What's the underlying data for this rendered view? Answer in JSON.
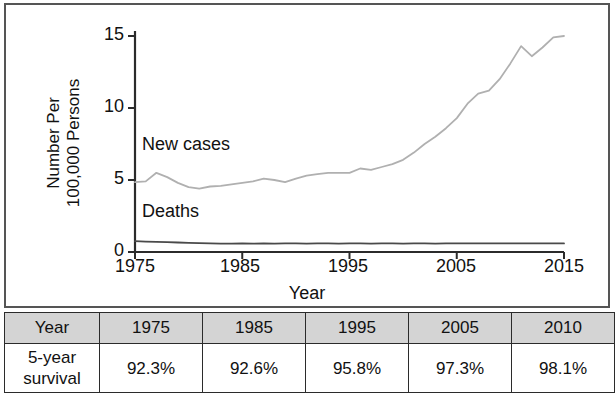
{
  "chart_data": {
    "type": "line",
    "title": "",
    "xlabel": "Year",
    "ylabel_line1": "Number Per",
    "ylabel_line2": "100,000 Persons",
    "xlim": [
      1975,
      2015
    ],
    "ylim": [
      0,
      15
    ],
    "xticks": [
      "1975",
      "1985",
      "1995",
      "2005",
      "2015"
    ],
    "xtick_values": [
      1975,
      1985,
      1995,
      2005,
      2015
    ],
    "yticks": [
      "0",
      "5",
      "10",
      "15"
    ],
    "ytick_values": [
      0,
      5,
      10,
      15
    ],
    "grid": false,
    "legend_position": "inline-annotation",
    "annotations": [
      {
        "text": "New cases",
        "x": 1977,
        "y": 7.3
      },
      {
        "text": "Deaths",
        "x": 1977,
        "y": 2.3
      }
    ],
    "series": [
      {
        "name": "New cases",
        "color": "#b0b0b0",
        "x": [
          1975,
          1976,
          1977,
          1978,
          1979,
          1980,
          1981,
          1982,
          1983,
          1984,
          1985,
          1986,
          1987,
          1988,
          1989,
          1990,
          1991,
          1992,
          1993,
          1994,
          1995,
          1996,
          1997,
          1998,
          1999,
          2000,
          2001,
          2002,
          2003,
          2004,
          2005,
          2006,
          2007,
          2008,
          2009,
          2010,
          2011,
          2012,
          2013,
          2014,
          2015
        ],
        "values": [
          4.85,
          4.9,
          5.5,
          5.2,
          4.8,
          4.5,
          4.4,
          4.55,
          4.6,
          4.7,
          4.8,
          4.9,
          5.1,
          5.0,
          4.85,
          5.1,
          5.3,
          5.4,
          5.5,
          5.5,
          5.5,
          5.8,
          5.7,
          5.9,
          6.1,
          6.4,
          6.9,
          7.5,
          8.0,
          8.6,
          9.3,
          10.3,
          11.0,
          11.2,
          12.0,
          13.1,
          14.3,
          13.6,
          14.2,
          14.9,
          15.0
        ]
      },
      {
        "name": "Deaths",
        "color": "#4a4a4a",
        "x": [
          1975,
          1976,
          1977,
          1978,
          1979,
          1980,
          1981,
          1982,
          1983,
          1984,
          1985,
          1986,
          1987,
          1988,
          1989,
          1990,
          1991,
          1992,
          1993,
          1994,
          1995,
          1996,
          1997,
          1998,
          1999,
          2000,
          2001,
          2002,
          2003,
          2004,
          2005,
          2006,
          2007,
          2008,
          2009,
          2010,
          2011,
          2012,
          2013,
          2014,
          2015
        ],
        "values": [
          0.75,
          0.72,
          0.7,
          0.68,
          0.66,
          0.64,
          0.62,
          0.6,
          0.58,
          0.58,
          0.6,
          0.58,
          0.6,
          0.58,
          0.6,
          0.6,
          0.58,
          0.6,
          0.6,
          0.58,
          0.6,
          0.6,
          0.58,
          0.6,
          0.6,
          0.58,
          0.6,
          0.6,
          0.58,
          0.6,
          0.6,
          0.6,
          0.6,
          0.6,
          0.6,
          0.6,
          0.6,
          0.6,
          0.6,
          0.6,
          0.6
        ]
      }
    ]
  },
  "table": {
    "header": [
      "Year",
      "1975",
      "1985",
      "1995",
      "2005",
      "2010"
    ],
    "rows": [
      {
        "label_line1": "5-year",
        "label_line2": "survival",
        "values": [
          "92.3%",
          "92.6%",
          "95.8%",
          "97.3%",
          "98.1%"
        ]
      }
    ]
  },
  "colors": {
    "new_cases_line": "#b0b0b0",
    "deaths_line": "#4a4a4a",
    "axis": "#2b2b2b",
    "table_header_bg": "#d4d4d4",
    "frame": "#555555"
  }
}
